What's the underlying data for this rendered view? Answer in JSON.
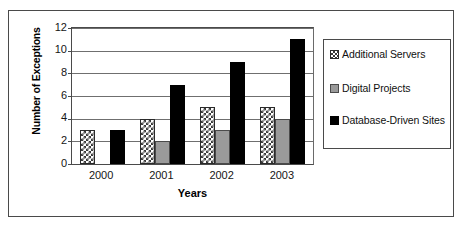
{
  "chart_data": {
    "type": "bar",
    "title": "",
    "subtitle": "",
    "xlabel": "Years",
    "ylabel": "Number of Exceptions",
    "categories": [
      "2000",
      "2001",
      "2002",
      "2003"
    ],
    "series": [
      {
        "name": "Additional Servers",
        "values": [
          3,
          4,
          5,
          5
        ],
        "color": "#ffffff",
        "pattern": "checkered"
      },
      {
        "name": "Digital Projects",
        "values": [
          0,
          2,
          3,
          4
        ],
        "color": "#9a9a9a",
        "pattern": "solid-gray"
      },
      {
        "name": "Database-Driven Sites",
        "values": [
          3,
          7,
          9,
          11
        ],
        "color": "#000000",
        "pattern": "solid-black"
      }
    ],
    "ylim": [
      0,
      12
    ],
    "ytick_labels": [
      "0",
      "2",
      "4",
      "6",
      "8",
      "10",
      "12"
    ],
    "ytick_values": [
      0,
      2,
      4,
      6,
      8,
      10,
      12
    ],
    "grid": "horizontal",
    "legend_position": "right",
    "legend_entries": [
      "Additional Servers",
      "Digital Projects",
      "Database-Driven Sites"
    ]
  }
}
